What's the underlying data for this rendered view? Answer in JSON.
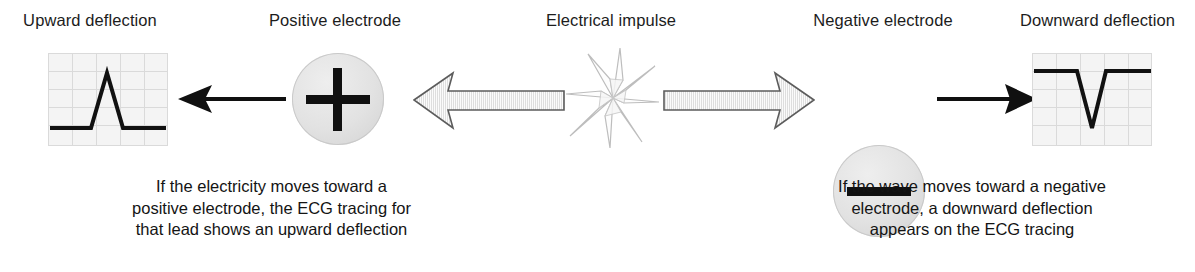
{
  "diagram": {
    "title_row": [
      {
        "id": "upward-deflection",
        "label": "Upward deflection"
      },
      {
        "id": "positive-electrode",
        "label": "Positive electrode"
      },
      {
        "id": "electrical-impulse",
        "label": "Electrical impulse"
      },
      {
        "id": "negative-electrode",
        "label": "Negative electrode"
      },
      {
        "id": "downward-deflection",
        "label": "Downward deflection"
      }
    ],
    "symbols": {
      "positive_sign": "+",
      "negative_sign": "−",
      "left_arrow": "left-arrow",
      "right_arrow": "right-arrow",
      "left_block_arrow": "left-block-arrow",
      "right_block_arrow": "right-block-arrow",
      "impulse_burst": "starburst-icon"
    },
    "captions": {
      "left": {
        "line1": "If the electricity moves toward a",
        "line2": "positive electrode, the ECG tracing for",
        "line3": "that lead shows an upward deflection"
      },
      "right": {
        "line1": "If the wave moves toward a negative",
        "line2": "electrode, a downward deflection",
        "line3": "appears on the ECG tracing"
      }
    },
    "tracings": {
      "upward": {
        "name": "upward-deflection-tracing",
        "direction": "up"
      },
      "downward": {
        "name": "downward-deflection-tracing",
        "direction": "down"
      }
    },
    "colors": {
      "background": "#ffffff",
      "text": "#1a1a1a",
      "trace_line": "#111111",
      "grid_paper": "#f4f4f4",
      "grid_line": "#d8d8d8",
      "electrode_fill": "#e4e4e4",
      "electrode_stroke": "#c9c9c9",
      "block_arrow_fill": "#f2f2f2",
      "block_arrow_stroke": "#595959",
      "burst_stroke": "#b8b8b8"
    }
  }
}
